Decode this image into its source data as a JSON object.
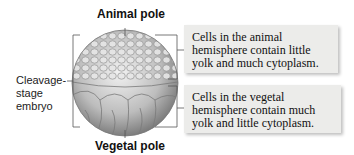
{
  "labels": {
    "top_pole": "Animal pole",
    "bottom_pole": "Vegetal pole",
    "side_line1": "Cleavage-",
    "side_line2": "stage",
    "side_line3": "embryo"
  },
  "callouts": [
    {
      "text": "Cells in the animal hemisphere contain little yolk and much cytoplasm."
    },
    {
      "text": "Cells in the vegetal hemisphere contain much yolk and little cytoplasm."
    }
  ],
  "colors": {
    "box_bg": "#ececea",
    "line": "#555555",
    "cell_light": "#d9d9d9",
    "cell_dark": "#7a7a7a"
  }
}
